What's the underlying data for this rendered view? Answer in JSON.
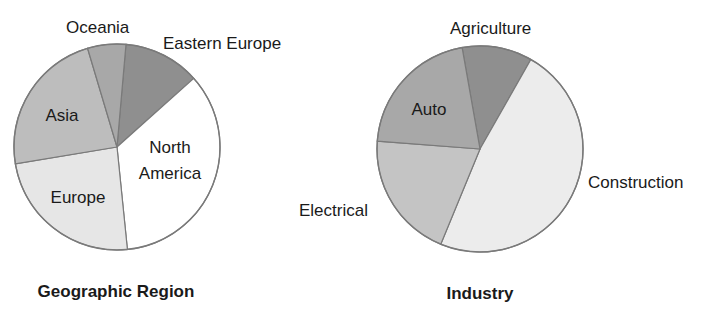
{
  "chart_data": [
    {
      "type": "pie",
      "title": "Geographic Region",
      "start_angle_deg": 5,
      "direction": "clockwise",
      "categories": [
        "Eastern Europe",
        "North America",
        "Europe",
        "Asia",
        "Oceania"
      ],
      "values": [
        12,
        35,
        24,
        23,
        6
      ],
      "colors": [
        "#8f8f8f",
        "#ffffff",
        "#e6e6e6",
        "#bdbdbd",
        "#a8a8a8"
      ],
      "geometry": {
        "cx": 117,
        "cy": 147,
        "r": 103
      },
      "labels": [
        {
          "text": "Eastern Europe",
          "x": 163,
          "y": 49,
          "anchor": "start",
          "lines": [
            "Eastern Europe"
          ]
        },
        {
          "text": "North America",
          "x": 170,
          "y": 153,
          "anchor": "middle",
          "lines": [
            "North",
            "America"
          ]
        },
        {
          "text": "Europe",
          "x": 78,
          "y": 203,
          "anchor": "middle",
          "lines": [
            "Europe"
          ]
        },
        {
          "text": "Asia",
          "x": 62,
          "y": 121,
          "anchor": "middle",
          "lines": [
            "Asia"
          ]
        },
        {
          "text": "Oceania",
          "x": 66,
          "y": 33,
          "anchor": "start",
          "lines": [
            "Oceania"
          ]
        }
      ],
      "title_pos": {
        "x": 116,
        "y": 297
      }
    },
    {
      "type": "pie",
      "title": "Industry",
      "start_angle_deg": 350,
      "direction": "clockwise",
      "categories": [
        "Agriculture",
        "Construction",
        "Electrical",
        "Auto"
      ],
      "values": [
        11,
        48,
        20,
        21
      ],
      "colors": [
        "#8f8f8f",
        "#ececec",
        "#c4c4c4",
        "#a8a8a8"
      ],
      "geometry": {
        "cx": 480,
        "cy": 149,
        "r": 103
      },
      "labels": [
        {
          "text": "Agriculture",
          "x": 450,
          "y": 34,
          "anchor": "start",
          "lines": [
            "Agriculture"
          ]
        },
        {
          "text": "Construction",
          "x": 588,
          "y": 188,
          "anchor": "start",
          "lines": [
            "Construction"
          ]
        },
        {
          "text": "Electrical",
          "x": 299,
          "y": 216,
          "anchor": "start",
          "lines": [
            "Electrical"
          ]
        },
        {
          "text": "Auto",
          "x": 429,
          "y": 115,
          "anchor": "middle",
          "lines": [
            "Auto"
          ]
        }
      ],
      "title_pos": {
        "x": 480,
        "y": 299
      }
    }
  ]
}
